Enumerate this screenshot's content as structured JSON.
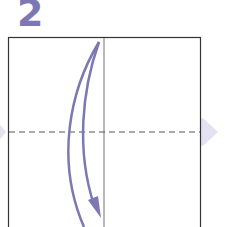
{
  "step": {
    "number": "2"
  },
  "colors": {
    "accent": "#7b78b3",
    "paper_edge": "#333333",
    "crease": "#999999",
    "dashed_fold": "#555555",
    "side_arrow": "#e4e2f2"
  },
  "diagram": {
    "square": {
      "x": 8,
      "y": 37,
      "width": 192,
      "height": 200
    },
    "center_crease_x": 104,
    "dashed_fold_y": 132
  }
}
